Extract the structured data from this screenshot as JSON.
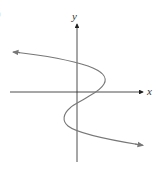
{
  "figure": {
    "part_label": ")",
    "x_axis_label": "x",
    "y_axis_label": "y",
    "colors": {
      "axes": "#222222",
      "curve": "#777777",
      "background": "#ffffff"
    }
  }
}
